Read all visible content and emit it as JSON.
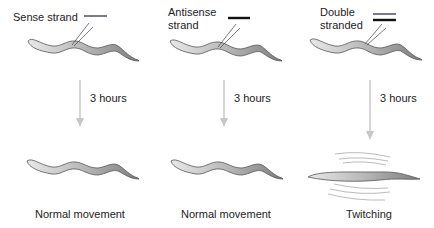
{
  "panels": [
    {
      "id": "sense",
      "label_lines": [
        "Sense strand"
      ],
      "strand_type": "single-light",
      "time_label": "3 hours",
      "outcome": "Normal movement"
    },
    {
      "id": "antisense",
      "label_lines": [
        "Antisense",
        "strand"
      ],
      "strand_type": "single-dark",
      "time_label": "3 hours",
      "outcome": "Normal movement"
    },
    {
      "id": "double",
      "label_lines": [
        "Double",
        "stranded"
      ],
      "strand_type": "double",
      "time_label": "3 hours",
      "outcome": "Twitching"
    }
  ],
  "colors": {
    "sense_strand": "#7a7a8a",
    "antisense_strand": "#111111",
    "arrow": "#c8c8c8",
    "worm_light": "#e4e4e4",
    "worm_dark": "#8a8a8a"
  }
}
